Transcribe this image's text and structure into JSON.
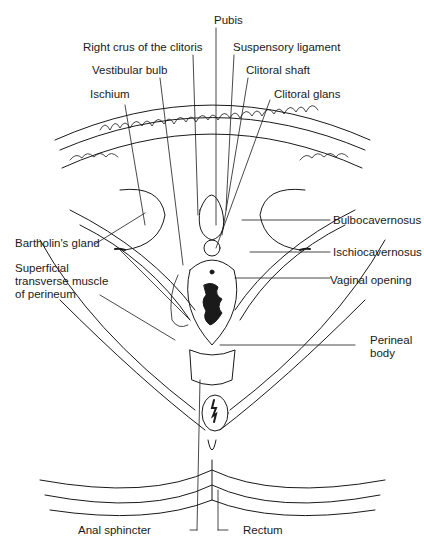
{
  "figure": {
    "type": "anatomical-illustration",
    "style": "black line drawing on white",
    "colors": {
      "ink": "#1a1a1a",
      "background": "#ffffff"
    }
  },
  "labels": {
    "pubis": "Pubis",
    "right_crus": "Right crus of the clitoris",
    "suspensory_ligament": "Suspensory ligament",
    "vestibular_bulb": "Vestibular bulb",
    "clitoral_shaft": "Clitoral shaft",
    "ischium": "Ischium",
    "clitoral_glans": "Clitoral glans",
    "bulbocavernosus": "Bulbocavernosus",
    "bartholins_gland": "Bartholin's gland",
    "ischiocavernosus": "Ischiocavernosus",
    "superficial_transverse": "Superficial\ntransverse muscle\nof perineum",
    "vaginal_opening": "Vaginal opening",
    "perineal_body": "Perineal\nbody",
    "anal_sphincter": "Anal sphincter",
    "rectum": "Rectum"
  }
}
